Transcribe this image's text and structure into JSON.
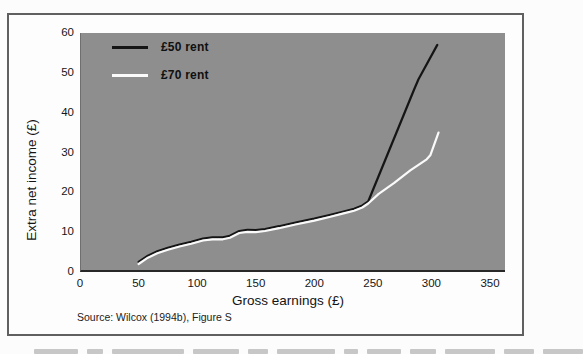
{
  "figure": {
    "y_axis_title": "Extra net income (£)",
    "x_axis_title": "Gross earnings (£)",
    "source": "Source: Wilcox (1994b), Figure S"
  },
  "chart_data": {
    "type": "line",
    "title": "",
    "xlabel": "Gross earnings (£)",
    "ylabel": "Extra net income (£)",
    "xlim": [
      0,
      350
    ],
    "ylim": [
      0,
      60
    ],
    "x_ticks": [
      0,
      50,
      100,
      150,
      200,
      250,
      300,
      350
    ],
    "y_ticks": [
      0,
      10,
      20,
      30,
      40,
      50,
      60
    ],
    "grid": false,
    "legend_position": "top-left",
    "plot_bg_color": "#8e8e8e",
    "frame_border_color": "#606060",
    "series": [
      {
        "name": "£50 rent",
        "color": "#151515",
        "points": [
          [
            50,
            2.5
          ],
          [
            58,
            4.1
          ],
          [
            66,
            5.2
          ],
          [
            75,
            6.1
          ],
          [
            85,
            6.9
          ],
          [
            95,
            7.6
          ],
          [
            105,
            8.4
          ],
          [
            113,
            8.7
          ],
          [
            122,
            8.7
          ],
          [
            128,
            9.1
          ],
          [
            136,
            10.3
          ],
          [
            143,
            10.6
          ],
          [
            150,
            10.5
          ],
          [
            158,
            10.8
          ],
          [
            170,
            11.5
          ],
          [
            185,
            12.5
          ],
          [
            200,
            13.4
          ],
          [
            213,
            14.3
          ],
          [
            225,
            15.2
          ],
          [
            234,
            15.9
          ],
          [
            241,
            16.7
          ],
          [
            246,
            17.7
          ],
          [
            285,
            45.7
          ],
          [
            289,
            48.4
          ],
          [
            305,
            57
          ]
        ]
      },
      {
        "name": "£70 rent",
        "color": "#fafafa",
        "points": [
          [
            50,
            2.0
          ],
          [
            58,
            3.6
          ],
          [
            66,
            4.7
          ],
          [
            75,
            5.6
          ],
          [
            85,
            6.4
          ],
          [
            95,
            7.1
          ],
          [
            105,
            7.9
          ],
          [
            113,
            8.2
          ],
          [
            122,
            8.2
          ],
          [
            128,
            8.6
          ],
          [
            136,
            9.8
          ],
          [
            143,
            10.1
          ],
          [
            150,
            10.0
          ],
          [
            158,
            10.3
          ],
          [
            170,
            11.0
          ],
          [
            185,
            12.0
          ],
          [
            200,
            12.9
          ],
          [
            213,
            13.8
          ],
          [
            225,
            14.7
          ],
          [
            234,
            15.4
          ],
          [
            241,
            16.2
          ],
          [
            246,
            17.2
          ],
          [
            255,
            19.6
          ],
          [
            268,
            22.3
          ],
          [
            282,
            25.5
          ],
          [
            296,
            28.3
          ],
          [
            299,
            29.3
          ],
          [
            306,
            35
          ]
        ]
      }
    ],
    "source": "Source: Wilcox (1994b), Figure S"
  }
}
